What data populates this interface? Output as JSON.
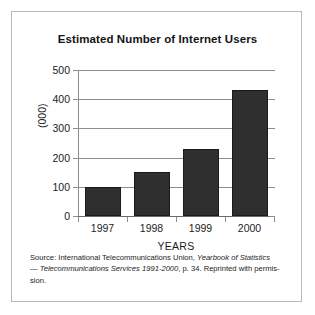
{
  "figure": {
    "title": "Estimated Number of Internet Users",
    "background_color": "#ffffff",
    "border_color": "#b9b9b9",
    "bar_color": "#2f2f2f",
    "gridline_color": "#8e8e8e"
  },
  "axes": {
    "y_title": "(000)",
    "x_title": "YEARS",
    "y_ticks": [
      "0",
      "100",
      "200",
      "300",
      "400",
      "500"
    ],
    "x_ticks": [
      "1997",
      "1998",
      "1999",
      "2000"
    ]
  },
  "caption": {
    "line1_a": "Source: International Telecommunications Union, ",
    "line1_italic": "Yearbook of Statistics",
    "line2_dash": "— ",
    "line2_italic": "Telecommunications Services 1991-2000",
    "line2_b": ", p. 34. Reprinted with permis-",
    "line3": "sion."
  },
  "chart_data": {
    "type": "bar",
    "title": "Estimated Number of Internet Users",
    "xlabel": "YEARS",
    "ylabel": "(000)",
    "categories": [
      "1997",
      "1998",
      "1999",
      "2000"
    ],
    "values": [
      100,
      150,
      230,
      430
    ],
    "ylim": [
      0,
      500
    ],
    "ytick_values": [
      0,
      100,
      200,
      300,
      400,
      500
    ],
    "grid": true,
    "legend": "none",
    "series": [
      {
        "name": "Estimated Internet Users (000)",
        "values": [
          100,
          150,
          230,
          430
        ]
      }
    ]
  }
}
